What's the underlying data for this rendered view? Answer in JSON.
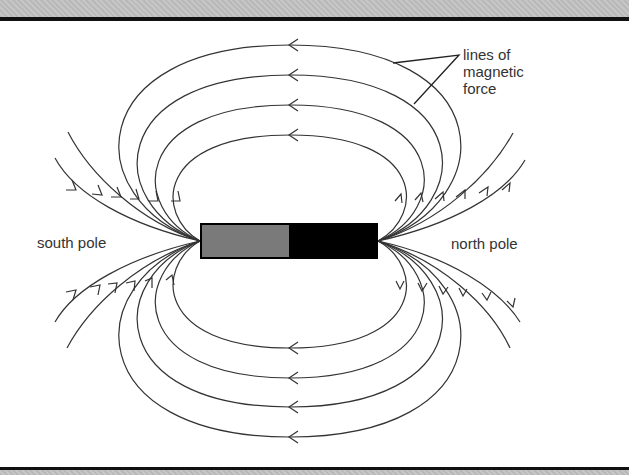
{
  "diagram": {
    "labels": {
      "south_pole": "south pole",
      "north_pole": "north pole",
      "callout_line1": "lines of",
      "callout_line2": "magnetic",
      "callout_line3": "force"
    },
    "magnet": {
      "south_color": "#7a7a7a",
      "north_color": "#000000"
    },
    "line_color": "#333333"
  }
}
